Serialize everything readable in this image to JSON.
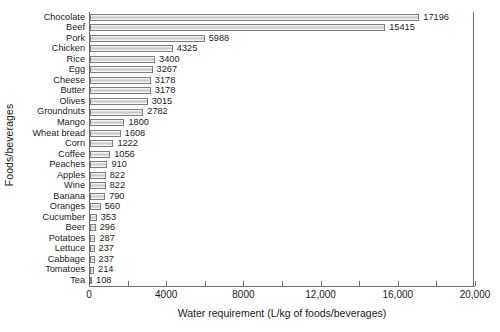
{
  "chart_data": {
    "type": "bar",
    "orientation": "horizontal",
    "title": "",
    "xlabel": "Water requirement (L/kg of foods/beverages)",
    "ylabel": "Foods/beverages",
    "xlim": [
      0,
      20000
    ],
    "xticks": [
      0,
      4000,
      8000,
      12000,
      16000,
      20000
    ],
    "xtick_labels": [
      "0",
      "4000",
      "8000",
      "12,000",
      "16,000",
      "20,000"
    ],
    "minor_tick_interval": 2000,
    "grid": false,
    "legend": null,
    "categories": [
      "Chocolate",
      "Beef",
      "Pork",
      "Chicken",
      "Rice",
      "Egg",
      "Cheese",
      "Butter",
      "Olives",
      "Groundnuts",
      "Mango",
      "Wheat bread",
      "Corn",
      "Coffee",
      "Peaches",
      "Apples",
      "Wine",
      "Banana",
      "Oranges",
      "Cucumber",
      "Beer",
      "Potatoes",
      "Lettuce",
      "Cabbage",
      "Tomatoes",
      "Tea"
    ],
    "values": [
      17196,
      15415,
      5988,
      4325,
      3400,
      3267,
      3178,
      3178,
      3015,
      2782,
      1800,
      1608,
      1222,
      1056,
      910,
      822,
      822,
      790,
      560,
      353,
      296,
      287,
      237,
      237,
      214,
      108
    ],
    "value_labels": [
      "17196",
      "15415",
      "5988",
      "4325",
      "3400",
      "3267",
      "3178",
      "3178",
      "3015",
      "2782",
      "1800",
      "1608",
      "1222",
      "1056",
      "910",
      "822",
      "822",
      "790",
      "560",
      "353",
      "296",
      "287",
      "237",
      "237",
      "214",
      "108"
    ],
    "bar_outline_color": "#7d7d7d",
    "bar_fill_color": "#c9c9c9",
    "axis_color": "#6d6d6d"
  }
}
